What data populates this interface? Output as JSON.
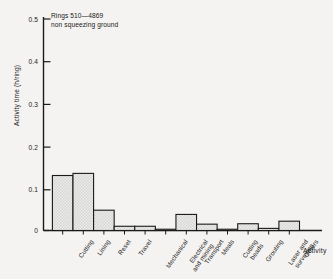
{
  "chart_data": {
    "type": "bar",
    "title": "",
    "subtitle": "",
    "xlabel": "Activity",
    "ylabel": "Activity time (h/ring)",
    "ylim": [
      0,
      0.5
    ],
    "ytick_labels": [
      "0",
      "0.1",
      "0.2",
      "0.3",
      "0.4",
      "0.5"
    ],
    "ytick_values": [
      0,
      0.1,
      0.2,
      0.3,
      0.4,
      0.5
    ],
    "grid": false,
    "legend": null,
    "annotations": [
      "Rings 510—4869",
      "non squeezing ground"
    ],
    "bar_style": {
      "fill": "#e9e9e7",
      "pattern": "light-checkered-hatch",
      "edge": "#1a1a1a",
      "contiguous": true
    },
    "categories": [
      "Cutting",
      "Lining",
      "Reset",
      "Travel",
      "Mechanical",
      "Electrical and mining",
      "Transport",
      "Meals",
      "Cutting beads",
      "Grouting",
      "Laser and surveying",
      "Others"
    ],
    "category_lines": [
      [
        "Cutting"
      ],
      [
        "Lining"
      ],
      [
        "Reset"
      ],
      [
        "Travel"
      ],
      [
        "Mechanical"
      ],
      [
        "Electrical",
        "and mining"
      ],
      [
        "Transport"
      ],
      [
        "Meals"
      ],
      [
        "Cutting",
        "beads"
      ],
      [
        "Grouting"
      ],
      [
        "Laser and",
        "surveying"
      ],
      [
        "Others"
      ]
    ],
    "values": [
      0.13,
      0.135,
      0.048,
      0.01,
      0.01,
      0.003,
      0.038,
      0.015,
      0.003,
      0.016,
      0.005,
      0.022
    ]
  },
  "figure": {
    "background_color": "#f4f3f1",
    "axis_color": "#1a1a1a"
  }
}
